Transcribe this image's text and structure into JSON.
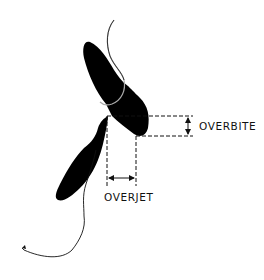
{
  "diagram": {
    "labels": {
      "overbite": "OVERBITE",
      "overjet": "OVERJET"
    },
    "colors": {
      "tooth_fill": "#000000",
      "line": "#111111",
      "background": "#ffffff"
    },
    "elements": [
      {
        "name": "upper-incisor",
        "kind": "tooth silhouette"
      },
      {
        "name": "lower-incisor",
        "kind": "tooth silhouette"
      },
      {
        "name": "upper-gum-line",
        "kind": "outline curve"
      },
      {
        "name": "lower-gum-line",
        "kind": "outline curve"
      },
      {
        "name": "overbite-measure",
        "kind": "vertical double arrow between dashed guides"
      },
      {
        "name": "overjet-measure",
        "kind": "horizontal double arrow between dashed guides"
      }
    ]
  }
}
